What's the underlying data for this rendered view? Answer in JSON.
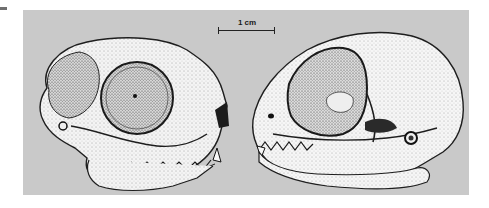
{
  "figure": {
    "background_color": "#c9c9c9",
    "scale_bar": {
      "label": "1 cm"
    },
    "views": [
      {
        "name": "lateral-view-left-facing-right",
        "description": "skull in lateral view, facing right"
      },
      {
        "name": "lateral-view-right-facing-left",
        "description": "skull in lateral view, facing left"
      }
    ]
  }
}
